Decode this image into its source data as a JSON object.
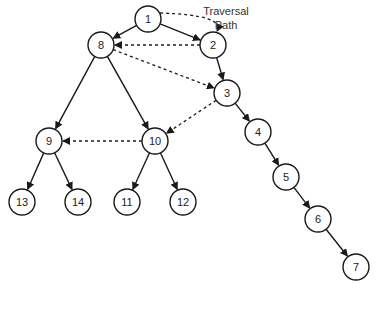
{
  "caption": {
    "line1": "Traversal",
    "line2": "Path"
  },
  "colors": {
    "stroke": "#1a1a1a",
    "fill": "#ffffff",
    "text": "#222222"
  },
  "nodes": [
    {
      "id": "1",
      "x": 148,
      "y": 19
    },
    {
      "id": "2",
      "x": 213,
      "y": 45
    },
    {
      "id": "8",
      "x": 101,
      "y": 45
    },
    {
      "id": "3",
      "x": 227,
      "y": 93
    },
    {
      "id": "9",
      "x": 49,
      "y": 141
    },
    {
      "id": "10",
      "x": 155,
      "y": 141
    },
    {
      "id": "4",
      "x": 258,
      "y": 132
    },
    {
      "id": "13",
      "x": 22,
      "y": 202
    },
    {
      "id": "14",
      "x": 78,
      "y": 202
    },
    {
      "id": "11",
      "x": 127,
      "y": 202
    },
    {
      "id": "12",
      "x": 183,
      "y": 202
    },
    {
      "id": "5",
      "x": 286,
      "y": 177
    },
    {
      "id": "6",
      "x": 318,
      "y": 219
    },
    {
      "id": "7",
      "x": 356,
      "y": 267
    }
  ],
  "edges": [
    [
      "1",
      "8"
    ],
    [
      "1",
      "2"
    ],
    [
      "2",
      "3"
    ],
    [
      "3",
      "4"
    ],
    [
      "4",
      "5"
    ],
    [
      "5",
      "6"
    ],
    [
      "6",
      "7"
    ],
    [
      "8",
      "9"
    ],
    [
      "8",
      "10"
    ],
    [
      "9",
      "13"
    ],
    [
      "9",
      "14"
    ],
    [
      "10",
      "11"
    ],
    [
      "10",
      "12"
    ]
  ],
  "traversal": [
    [
      "1",
      "2",
      "curve"
    ],
    [
      "2",
      "8",
      "line"
    ],
    [
      "8",
      "3",
      "line"
    ],
    [
      "3",
      "10",
      "line"
    ],
    [
      "10",
      "9",
      "line"
    ]
  ]
}
